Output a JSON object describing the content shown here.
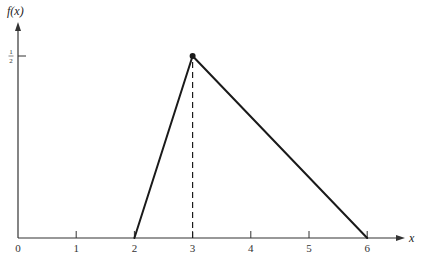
{
  "chart_data": {
    "type": "line",
    "title": "",
    "xlabel": "x",
    "ylabel": "f(x)",
    "xlim": [
      0,
      6.6
    ],
    "ylim": [
      0,
      0.6
    ],
    "grid": false,
    "x_ticks": [
      {
        "value": 0,
        "label": "0"
      },
      {
        "value": 1,
        "label": "1"
      },
      {
        "value": 2,
        "label": "2"
      },
      {
        "value": 3,
        "label": "3"
      },
      {
        "value": 4,
        "label": "4"
      },
      {
        "value": 5,
        "label": "5"
      },
      {
        "value": 6,
        "label": "6"
      }
    ],
    "y_ticks": [
      {
        "value": 0.5,
        "numerator": "1",
        "denominator": "2"
      }
    ],
    "series": [
      {
        "name": "f(x)",
        "style": "solid",
        "points": [
          {
            "x": 2,
            "y": 0
          },
          {
            "x": 3,
            "y": 0.5
          },
          {
            "x": 6,
            "y": 0
          }
        ]
      }
    ],
    "peak_marker": {
      "x": 3,
      "y": 0.5
    },
    "annotations": [
      {
        "type": "dashed-vertical",
        "x": 3,
        "from_y": 0,
        "to_y": 0.5
      }
    ]
  },
  "colors": {
    "axis": "#333333",
    "line": "#1a1a1a"
  }
}
